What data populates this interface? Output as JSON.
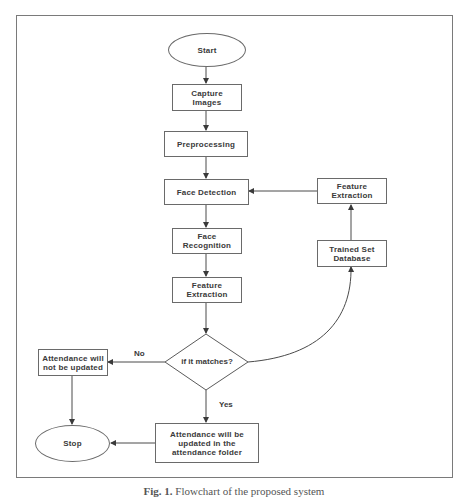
{
  "diagram": {
    "type": "flowchart",
    "nodes": {
      "start": "Start",
      "capture_images": "Capture\nImages",
      "preprocessing": "Preprocessing",
      "face_detection": "Face Detection",
      "face_recognition": "Face\nRecognition",
      "feature_extraction_left": "Feature\nExtraction",
      "decision": "if it matches?",
      "feature_extraction_right": "Feature\nExtraction",
      "trained_set_database": "Trained Set\nDatabase",
      "not_updated": "Attendance will\nnot be updated",
      "stop": "Stop",
      "updated": "Attendance will be\nupdated in the\nattendance folder"
    },
    "edge_labels": {
      "no": "No",
      "yes": "Yes"
    },
    "edges": [
      [
        "start",
        "capture_images"
      ],
      [
        "capture_images",
        "preprocessing"
      ],
      [
        "preprocessing",
        "face_detection"
      ],
      [
        "face_detection",
        "face_recognition"
      ],
      [
        "face_recognition",
        "feature_extraction_left"
      ],
      [
        "feature_extraction_left",
        "decision"
      ],
      [
        "decision",
        "not_updated",
        "No"
      ],
      [
        "decision",
        "updated",
        "Yes"
      ],
      [
        "decision",
        "trained_set_database"
      ],
      [
        "trained_set_database",
        "feature_extraction_right"
      ],
      [
        "feature_extraction_right",
        "face_detection"
      ],
      [
        "not_updated",
        "stop"
      ],
      [
        "updated",
        "stop"
      ]
    ]
  },
  "caption": {
    "prefix": "Fig. 1.",
    "text": "Flowchart of the proposed system"
  }
}
